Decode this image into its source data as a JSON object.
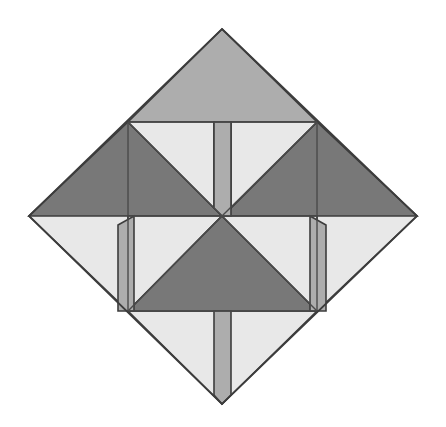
{
  "figure": {
    "canvas_width": 446,
    "canvas_height": 427,
    "background_color": "#ffffff",
    "outline_color": "#3c3c3c",
    "outline_width": 1.6
  },
  "palette": {
    "light_gray": "#e8e8e8",
    "medium_gray": "#adadad",
    "dark_gray": "#787878",
    "stroke": "#3c3c3c"
  },
  "geometry": {
    "diamond_vertices": {
      "top": [
        222,
        29
      ],
      "right": [
        417,
        216
      ],
      "bottom": [
        222,
        404
      ],
      "left": [
        29,
        216
      ]
    },
    "inner_square": {
      "top_left": [
        128,
        122
      ],
      "top_right": [
        317,
        122
      ],
      "bottom_right": [
        317,
        311
      ],
      "bottom_left": [
        128,
        311
      ]
    },
    "center": [
      222,
      216
    ],
    "strip_width": 17
  },
  "shapes": [
    {
      "id": "corner-top",
      "name": "top-corner-triangle",
      "fill": "#adadad",
      "points": "222,29 317,122 128,122"
    },
    {
      "id": "corner-left",
      "name": "left-corner-triangle",
      "fill": "#e8e8e8",
      "points": "29,216 128,122 128,311"
    },
    {
      "id": "corner-right",
      "name": "right-corner-triangle",
      "fill": "#e8e8e8",
      "points": "417,216 317,311 317,122"
    },
    {
      "id": "corner-bottom",
      "name": "bottom-corner-triangle",
      "fill": "#e8e8e8",
      "points": "222,404 128,311 317,311"
    },
    {
      "id": "vane-upper-left-dark",
      "name": "upper-left-dark-vane",
      "fill": "#787878",
      "points": "29,216 128,122 222,216"
    },
    {
      "id": "vane-upper-right-dark",
      "name": "upper-right-dark-vane",
      "fill": "#787878",
      "points": "417,216 317,122 222,216"
    },
    {
      "id": "vane-lower-left-light",
      "name": "lower-left-light-triangle",
      "fill": "#e8e8e8",
      "points": "128,216 222,216 128,311"
    },
    {
      "id": "vane-lower-dark",
      "name": "lower-center-dark-vane",
      "fill": "#787878",
      "points": "222,216 317,311 128,311"
    },
    {
      "id": "vane-lower-right-light",
      "name": "lower-right-light-triangle",
      "fill": "#e8e8e8",
      "points": "222,216 317,216 317,311"
    },
    {
      "id": "inner-upper-left-light",
      "name": "inner-upper-left-light-triangle",
      "fill": "#e8e8e8",
      "points": "128,122 214,122 214,208"
    },
    {
      "id": "inner-upper-right-light",
      "name": "inner-upper-right-light-triangle",
      "fill": "#e8e8e8",
      "points": "231,122 317,122 231,208"
    },
    {
      "id": "strip-top",
      "name": "top-vertical-strip",
      "fill": "#adadad",
      "points": "214,122 231,122 231,216 222,216 214,208"
    },
    {
      "id": "strip-bottom",
      "name": "bottom-vertical-strip",
      "fill": "#adadad",
      "points": "214,311 231,311 231,395 222,404 214,395"
    },
    {
      "id": "strip-left",
      "name": "left-vertical-strip",
      "fill": "#adadad",
      "points": "118,225 134,216 134,311 118,311"
    },
    {
      "id": "strip-right",
      "name": "right-vertical-strip",
      "fill": "#adadad",
      "points": "310,216 326,225 326,311 310,311"
    }
  ],
  "edges": [
    {
      "id": "edge-inner-top",
      "name": "inner-square-top-edge",
      "points": "128,122 317,122"
    },
    {
      "id": "edge-inner-bottom",
      "name": "inner-square-bottom-edge",
      "points": "128,311 317,311"
    },
    {
      "id": "edge-inner-left",
      "name": "inner-square-left-edge",
      "points": "128,122 128,311"
    },
    {
      "id": "edge-inner-right",
      "name": "inner-square-right-edge",
      "points": "317,122 317,311"
    },
    {
      "id": "edge-diag-nw",
      "name": "center-diagonal-northwest",
      "points": "128,122 222,216"
    },
    {
      "id": "edge-diag-ne",
      "name": "center-diagonal-northeast",
      "points": "317,122 222,216"
    },
    {
      "id": "edge-diag-sw",
      "name": "center-diagonal-southwest",
      "points": "128,311 222,216"
    },
    {
      "id": "edge-diag-se",
      "name": "center-diagonal-southeast",
      "points": "317,311 222,216"
    },
    {
      "id": "edge-mid-horizontal-left",
      "name": "center-horizontal-left",
      "points": "128,216 222,216"
    },
    {
      "id": "edge-mid-horizontal-right",
      "name": "center-horizontal-right",
      "points": "222,216 317,216"
    }
  ],
  "outer_outline": {
    "id": "diamond-outline",
    "name": "diamond-outer-boundary",
    "points": "222,29 417,216 222,404 29,216"
  }
}
